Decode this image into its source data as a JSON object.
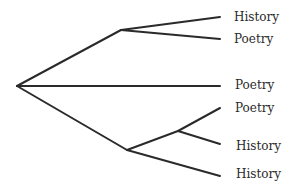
{
  "diagram": {
    "type": "tree",
    "line_color": "#2a2a2a",
    "leaves": [
      {
        "label": "History"
      },
      {
        "label": "Poetry"
      },
      {
        "label": "Poetry"
      },
      {
        "label": "Poetry"
      },
      {
        "label": "History"
      },
      {
        "label": "History"
      }
    ]
  }
}
